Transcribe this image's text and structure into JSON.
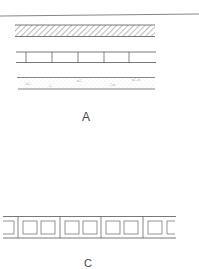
{
  "figure": {
    "panel_a": {
      "label": "A",
      "layers": [
        {
          "name": "top-rule",
          "type": "line"
        },
        {
          "name": "hatched-band",
          "type": "diagonal-hatching"
        },
        {
          "name": "segmented-band",
          "type": "cells",
          "cell_count": 6
        },
        {
          "name": "stippled-band",
          "type": "dotted-fill"
        }
      ]
    },
    "panel_c": {
      "label": "C",
      "layers": [
        {
          "name": "boxed-band",
          "type": "cells-with-square-voids",
          "section_count": 5
        }
      ]
    },
    "colors": {
      "line": "#555555",
      "hatch": "#777777",
      "stipple": "#aaaaaa",
      "background": "#ffffff"
    }
  }
}
